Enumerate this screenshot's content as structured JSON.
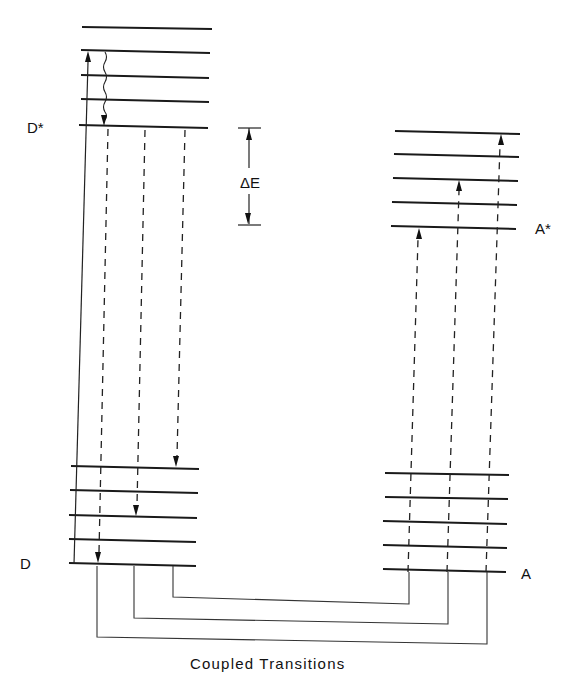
{
  "diagram": {
    "title": "Coupled Transitions",
    "labels": {
      "donor_excited": "D*",
      "donor_ground": "D",
      "acceptor_excited": "A*",
      "acceptor_ground": "A",
      "energy_gap": "ΔE",
      "caption": "Coupled Transitions"
    },
    "manifolds": [
      {
        "name": "D*",
        "levels_y": [
          27,
          50,
          75,
          100,
          126
        ],
        "x_start": 81,
        "x_end": 210
      },
      {
        "name": "D",
        "levels_y": [
          467,
          491,
          516,
          540,
          564
        ],
        "x_start": 70,
        "x_end": 198
      },
      {
        "name": "A*",
        "levels_y": [
          132,
          155,
          179,
          203,
          228
        ],
        "x_start": 393,
        "x_end": 520
      },
      {
        "name": "A",
        "levels_y": [
          474,
          497,
          522,
          546,
          570
        ],
        "x_start": 384,
        "x_end": 508
      }
    ],
    "transitions": [
      {
        "type": "absorption",
        "style": "solid",
        "from": "D level 0",
        "to": "D* level 1"
      },
      {
        "type": "vibrational-relaxation",
        "style": "wavy",
        "from": "D* level 1",
        "to": "D* level 0"
      },
      {
        "type": "donor-emission",
        "style": "dashed",
        "from": "D* level 0",
        "to": "D level 0"
      },
      {
        "type": "donor-emission",
        "style": "dashed",
        "from": "D* level 0",
        "to": "D level 2"
      },
      {
        "type": "donor-emission",
        "style": "dashed",
        "from": "D* level 0",
        "to": "D level 4"
      },
      {
        "type": "acceptor-absorption",
        "style": "dashed",
        "from": "A level 0",
        "to": "A* level 0"
      },
      {
        "type": "acceptor-absorption",
        "style": "dashed",
        "from": "A level 0",
        "to": "A* level 2"
      },
      {
        "type": "acceptor-absorption",
        "style": "dashed",
        "from": "A level 0",
        "to": "A* level 4"
      }
    ],
    "couplings": [
      {
        "donor_x": 173,
        "acceptor_x": 409,
        "level": "inner"
      },
      {
        "donor_x": 134,
        "acceptor_x": 448,
        "level": "middle"
      },
      {
        "donor_x": 97,
        "acceptor_x": 487,
        "level": "outer"
      }
    ]
  }
}
